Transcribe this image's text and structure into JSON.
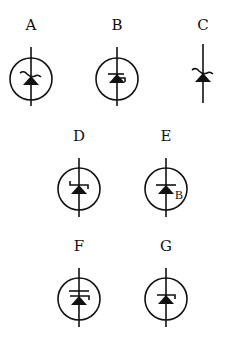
{
  "figure": {
    "colors": {
      "stroke": "#111111",
      "background": "#ffffff"
    },
    "symbols": [
      {
        "id": "A",
        "label": "A",
        "enclosed": true,
        "bar_style": "wavy",
        "extra_text": ""
      },
      {
        "id": "B",
        "label": "B",
        "enclosed": true,
        "bar_style": "right-hook-small",
        "extra_text": ""
      },
      {
        "id": "C",
        "label": "C",
        "enclosed": false,
        "bar_style": "wavy",
        "extra_text": ""
      },
      {
        "id": "D",
        "label": "D",
        "enclosed": true,
        "bar_style": "z-hooks",
        "extra_text": ""
      },
      {
        "id": "E",
        "label": "E",
        "enclosed": true,
        "bar_style": "straight",
        "extra_text": "B"
      },
      {
        "id": "F",
        "label": "F",
        "enclosed": true,
        "bar_style": "right-hook",
        "extra_text": ""
      },
      {
        "id": "G",
        "label": "G",
        "enclosed": true,
        "bar_style": "right-hook-short",
        "extra_text": ""
      }
    ]
  }
}
